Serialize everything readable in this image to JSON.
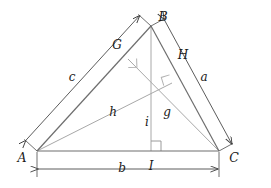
{
  "figure": {
    "type": "geometry-diagram",
    "background_color": "#ffffff"
  },
  "colors": {
    "triangle_edge": "#6e6e6e",
    "cevian": "#a8a8a8",
    "dimension_line": "#4a4a4a",
    "right_angle_mark": "#b0b0b0",
    "right_angle_mark_dark": "#8c8c8c",
    "text": "#1a1a1a"
  },
  "vertices": [
    {
      "id": "A",
      "label": "A",
      "x": 37,
      "y": 151,
      "label_x": 22,
      "label_y": 158
    },
    {
      "id": "B",
      "label": "B",
      "x": 151,
      "y": 26,
      "label_x": 163,
      "label_y": 17
    },
    {
      "id": "C",
      "label": "C",
      "x": 219,
      "y": 151,
      "label_x": 234,
      "label_y": 158
    }
  ],
  "feet": [
    {
      "id": "G",
      "label": "G",
      "x": 128,
      "y": 59,
      "label_x": 117,
      "label_y": 45,
      "on_side": "AB",
      "from_vertex": "C"
    },
    {
      "id": "H",
      "label": "H",
      "x": 172,
      "y": 83,
      "label_x": 183,
      "label_y": 55,
      "on_side": "BC",
      "from_vertex": "A"
    },
    {
      "id": "I",
      "label": "I",
      "x": 151,
      "y": 151,
      "label_x": 151,
      "label_y": 166,
      "on_side": "AC",
      "from_vertex": "B"
    }
  ],
  "sides": [
    {
      "id": "c",
      "label": "c",
      "from": "A",
      "to": "B",
      "label_x": 72,
      "label_y": 77,
      "dimension_offset": 14
    },
    {
      "id": "a",
      "label": "a",
      "from": "B",
      "to": "C",
      "label_x": 204,
      "label_y": 77,
      "dimension_offset": 14
    },
    {
      "id": "b",
      "label": "b",
      "from": "A",
      "to": "C",
      "label_x": 122,
      "label_y": 168,
      "dimension_y": 169
    }
  ],
  "altitudes": [
    {
      "id": "h",
      "label": "h",
      "from": "A",
      "to": "H",
      "label_x": 113,
      "label_y": 112
    },
    {
      "id": "g",
      "label": "g",
      "from": "C",
      "to": "G",
      "label_x": 167,
      "label_y": 112
    },
    {
      "id": "i",
      "label": "i",
      "from": "B",
      "to": "I",
      "label_x": 147,
      "label_y": 122
    }
  ],
  "right_angles": [
    {
      "id": "right-angle-at-G",
      "x": 128,
      "y": 59,
      "size": 9,
      "rotation": -47
    },
    {
      "id": "right-angle-at-H",
      "x": 172,
      "y": 83,
      "size": 9,
      "rotation": 118
    },
    {
      "id": "right-angle-at-I",
      "x": 151,
      "y": 151,
      "size": 10,
      "rotation": 0
    }
  ],
  "dimension_arrows": {
    "c_label": "c",
    "a_label": "a",
    "b_label": "b",
    "arrowhead_style": "open-v"
  }
}
